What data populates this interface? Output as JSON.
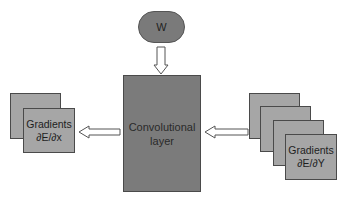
{
  "diagram": {
    "weight_node": {
      "label": "W"
    },
    "layer_node": {
      "line1": "Convolutional",
      "line2": "layer"
    },
    "output_gradients": {
      "line1": "Gradients",
      "line2": "∂E/∂x",
      "stack_count": 2
    },
    "input_gradients": {
      "line1": "Gradients",
      "line2": "∂E/∂Y",
      "stack_count": 4
    },
    "edges": [
      {
        "from": "W",
        "to": "Convolutional layer",
        "style": "hollow-arrow-down"
      },
      {
        "from": "Gradients ∂E/∂Y",
        "to": "Convolutional layer",
        "style": "hollow-arrow-left"
      },
      {
        "from": "Convolutional layer",
        "to": "Gradients ∂E/∂x",
        "style": "hollow-arrow-left"
      }
    ],
    "colors": {
      "node_fill": "#7b7b7b",
      "sheet_fill": "#a6a6a6",
      "border": "#4a4a4a"
    }
  }
}
